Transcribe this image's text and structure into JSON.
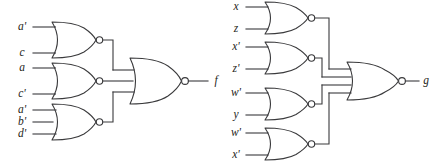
{
  "diagram": {
    "background_color": "#ffffff",
    "line_color": "#3a3a3c",
    "text_color": "#1e1e20",
    "circuits": [
      {
        "id": "circuit-f",
        "output_label": "f",
        "output_gate": {
          "type": "NOR",
          "inputs": 3
        },
        "gates": [
          {
            "id": "f-gate-1",
            "type": "NOR",
            "inputs": [
              "a'",
              "c"
            ]
          },
          {
            "id": "f-gate-2",
            "type": "NOR",
            "inputs": [
              "a",
              "c'"
            ]
          },
          {
            "id": "f-gate-3",
            "type": "NOR",
            "inputs": [
              "a'",
              "b'",
              "d'"
            ]
          }
        ]
      },
      {
        "id": "circuit-g",
        "output_label": "g",
        "output_gate": {
          "type": "NOR",
          "inputs": 4
        },
        "gates": [
          {
            "id": "g-gate-1",
            "type": "NOR",
            "inputs": [
              "x",
              "z"
            ]
          },
          {
            "id": "g-gate-2",
            "type": "NOR",
            "inputs": [
              "x'",
              "z'"
            ]
          },
          {
            "id": "g-gate-3",
            "type": "NOR",
            "inputs": [
              "w'",
              "y"
            ]
          },
          {
            "id": "g-gate-4",
            "type": "NOR",
            "inputs": [
              "w'",
              "x'"
            ]
          }
        ]
      }
    ],
    "labels": {
      "f_in_1": "a'",
      "f_in_2": "c",
      "f_in_3": "a",
      "f_in_4": "c'",
      "f_in_5": "a'",
      "f_in_6": "b'",
      "f_in_7": "d'",
      "f_out": "f",
      "g_in_1": "x",
      "g_in_2": "z",
      "g_in_3": "x'",
      "g_in_4": "z'",
      "g_in_5": "w'",
      "g_in_6": "y",
      "g_in_7": "w'",
      "g_in_8": "x'",
      "g_out": "g"
    }
  }
}
